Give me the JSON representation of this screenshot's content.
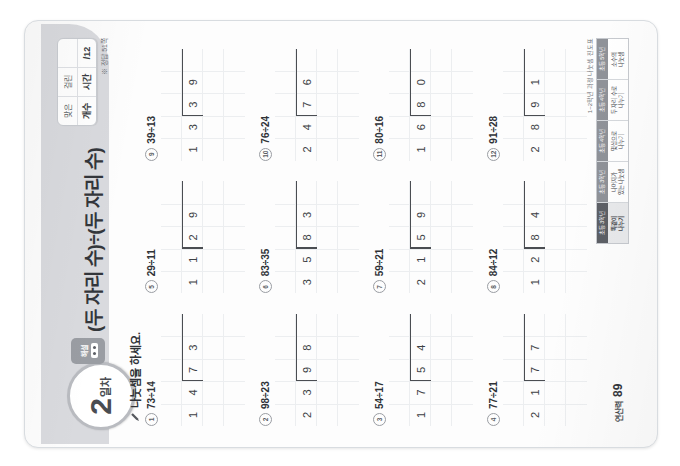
{
  "header": {
    "day_number": "2",
    "day_suffix": "일차",
    "tab_label": "해설",
    "title": "(두 자리 수)÷(두 자리 수)",
    "score": {
      "label_left_top": "맞은",
      "label_left_bottom": "개수",
      "label_right_top": "걸린",
      "label_right_bottom": "시간",
      "value": "/12"
    },
    "answer_note": "※ 정답 51쪽"
  },
  "instruction": "나눗셈을 하세요.",
  "problems": [
    {
      "num": "1",
      "expr": "73÷14",
      "divisor": [
        "1",
        "4"
      ],
      "dividend": [
        "7",
        "3"
      ],
      "quotient": [
        "",
        "5"
      ],
      "work_row3": [
        "",
        "",
        "",
        "3"
      ],
      "work_row4": [
        "",
        "",
        "7",
        "0"
      ],
      "remainder": [
        "",
        "",
        "",
        "3"
      ]
    },
    {
      "num": "5",
      "expr": "29÷11",
      "divisor": [
        "1",
        "1"
      ],
      "dividend": [
        "2",
        "9"
      ],
      "quotient": [
        "",
        "2"
      ],
      "work_row3": [
        "",
        "",
        "",
        "2"
      ],
      "work_row4": [
        "",
        "",
        "2",
        "2"
      ],
      "remainder": [
        "",
        "",
        "",
        "7"
      ]
    },
    {
      "num": "9",
      "expr": "39÷13",
      "divisor": [
        "1",
        "3"
      ],
      "dividend": [
        "3",
        "9"
      ],
      "quotient": [
        "",
        "3"
      ],
      "work_row3": [
        "",
        "",
        "",
        "3"
      ],
      "work_row4": [
        "",
        "",
        "3",
        "9"
      ],
      "remainder": [
        "",
        "",
        "",
        "0"
      ]
    },
    {
      "num": "2",
      "expr": "98÷23",
      "divisor": [
        "2",
        "3"
      ],
      "dividend": [
        "9",
        "8"
      ],
      "quotient": [
        "",
        "4"
      ],
      "work_row3": [
        "",
        "",
        "",
        "8"
      ],
      "work_row4": [
        "",
        "",
        "9",
        "2"
      ],
      "remainder": [
        "",
        "",
        "",
        "6"
      ]
    },
    {
      "num": "6",
      "expr": "83÷35",
      "divisor": [
        "3",
        "5"
      ],
      "dividend": [
        "8",
        "3"
      ],
      "quotient": [
        "",
        "2"
      ],
      "work_row3": [
        "",
        "",
        "",
        "3"
      ],
      "work_row4": [
        "",
        "",
        "7",
        "0"
      ],
      "remainder": [
        "",
        "",
        "",
        "1"
      ]
    },
    {
      "num": "10",
      "expr": "76÷24",
      "divisor": [
        "2",
        "4"
      ],
      "dividend": [
        "7",
        "6"
      ],
      "quotient": [
        "",
        "3"
      ],
      "work_row3": [
        "",
        "",
        "",
        "2"
      ],
      "work_row4": [
        "",
        "",
        "7",
        "2"
      ],
      "remainder": [
        "",
        "",
        "",
        "4"
      ]
    },
    {
      "num": "3",
      "expr": "54÷17",
      "divisor": [
        "1",
        "7"
      ],
      "dividend": [
        "5",
        "4"
      ],
      "quotient": [
        "",
        "3"
      ],
      "work_row3": [
        "",
        "",
        "",
        "1"
      ],
      "work_row4": [
        "",
        "",
        "5",
        "1"
      ],
      "remainder": [
        "",
        "",
        "",
        "3"
      ]
    },
    {
      "num": "7",
      "expr": "59÷21",
      "divisor": [
        "2",
        "1"
      ],
      "dividend": [
        "5",
        "9"
      ],
      "quotient": [
        "",
        "2"
      ],
      "work_row3": [
        "",
        "",
        "",
        "9"
      ],
      "work_row4": [
        "",
        "",
        "4",
        "2"
      ],
      "remainder": [
        "",
        "",
        "",
        "17"
      ]
    },
    {
      "num": "11",
      "expr": "80÷16",
      "divisor": [
        "1",
        "6"
      ],
      "dividend": [
        "8",
        "0"
      ],
      "quotient": [
        "",
        "5"
      ],
      "work_row3": [
        "",
        "",
        "",
        "0"
      ],
      "work_row4": [
        "",
        "",
        "8",
        "0"
      ],
      "remainder": [
        "",
        "",
        "",
        "0"
      ]
    },
    {
      "num": "4",
      "expr": "77÷21",
      "divisor": [
        "2",
        "1"
      ],
      "dividend": [
        "7",
        "7"
      ],
      "quotient": [
        "",
        "3"
      ],
      "work_row3": [
        "",
        "",
        "",
        "3"
      ],
      "work_row4": [
        "",
        "",
        "6",
        "3"
      ],
      "remainder": [
        "",
        "",
        "",
        "14"
      ]
    },
    {
      "num": "8",
      "expr": "84÷12",
      "divisor": [
        "1",
        "2"
      ],
      "dividend": [
        "8",
        "4"
      ],
      "quotient": [
        "",
        "7"
      ],
      "work_row3": [
        "",
        "",
        "",
        "7"
      ],
      "work_row4": [
        "",
        "",
        "8",
        "4"
      ],
      "remainder": [
        "",
        "",
        "",
        "0"
      ]
    },
    {
      "num": "12",
      "expr": "91÷28",
      "divisor": [
        "2",
        "8"
      ],
      "dividend": [
        "9",
        "1"
      ],
      "quotient": [
        "",
        "3"
      ],
      "work_row3": [
        "",
        "",
        "",
        "1"
      ],
      "work_row4": [
        "",
        "",
        "8",
        "4"
      ],
      "remainder": [
        "",
        "",
        "",
        "7"
      ]
    }
  ],
  "footer": {
    "page_kor": "연산력",
    "page_number": "89",
    "curriculum_caption": "1~2학년 과정 나눗셈 진도표",
    "curriculum": [
      {
        "head": "초등 3학년",
        "body": "똑같이\n나누기",
        "active": true
      },
      {
        "head": "초등 3학년",
        "body": "나머지가\n있는 나눗셈",
        "active": false
      },
      {
        "head": "초등 4학년",
        "body": "몇십으로\n나누기",
        "active": false
      },
      {
        "head": "초등 4학년",
        "body": "두 자리 수로\n나누기",
        "active": false
      },
      {
        "head": "초등 5학년",
        "body": "소수의\n나눗셈",
        "active": false
      }
    ]
  },
  "colors": {
    "band": "#d9dade",
    "ink": "#3c3f44",
    "grid": "#eceef0",
    "accent": "#5d6066"
  }
}
